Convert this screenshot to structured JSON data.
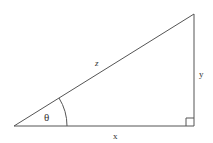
{
  "diagram": {
    "type": "right-triangle",
    "labels": {
      "hypotenuse": "z",
      "opposite": "y",
      "adjacent": "x",
      "angle": "θ"
    },
    "colors": {
      "line": "#555555",
      "text": "#333333",
      "background": "#ffffff"
    },
    "right_angle_marker": true
  }
}
